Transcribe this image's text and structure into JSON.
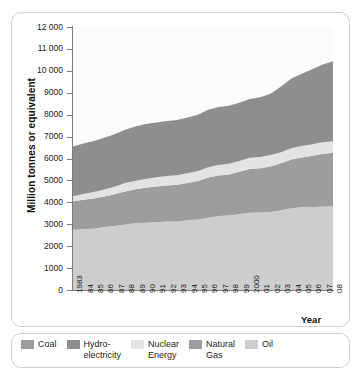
{
  "chart_data": {
    "type": "area",
    "stacked": true,
    "title": "",
    "subtitle": "",
    "xlabel": "Year",
    "ylabel": "Million tonnes or equivalent",
    "ylim": [
      0,
      12000
    ],
    "ytick_step": 1000,
    "ytick_labels": [
      "12 000",
      "11 000",
      "10 000",
      "9000",
      "8000",
      "7000",
      "6000",
      "5000",
      "4000",
      "3000",
      "2000",
      "1000",
      "0"
    ],
    "ytick_values": [
      12000,
      11000,
      10000,
      9000,
      8000,
      7000,
      6000,
      5000,
      4000,
      3000,
      2000,
      1000,
      0
    ],
    "grid": false,
    "legend_position": "bottom",
    "categories": [
      "1983",
      "84",
      "85",
      "86",
      "87",
      "88",
      "89",
      "90",
      "91",
      "92",
      "93",
      "94",
      "95",
      "96",
      "97",
      "98",
      "99",
      "2000",
      "01",
      "02",
      "03",
      "04",
      "05",
      "06",
      "07",
      "08"
    ],
    "x": [
      1983,
      1984,
      1985,
      1986,
      1987,
      1988,
      1989,
      1990,
      1991,
      1992,
      1993,
      1994,
      1995,
      1996,
      1997,
      1998,
      1999,
      2000,
      2001,
      2002,
      2003,
      2004,
      2005,
      2006,
      2007,
      2008
    ],
    "stack_order_bottom_to_top": [
      "Oil",
      "Natural Gas",
      "Nuclear Energy",
      "Hydro-electricity",
      "Coal"
    ],
    "series": [
      {
        "name": "Oil",
        "color": "#cdcdcd",
        "values": [
          2750,
          2780,
          2790,
          2870,
          2920,
          2990,
          3040,
          3070,
          3090,
          3120,
          3120,
          3180,
          3220,
          3300,
          3380,
          3400,
          3470,
          3520,
          3540,
          3560,
          3640,
          3730,
          3770,
          3790,
          3810,
          3820
        ]
      },
      {
        "name": "Natural Gas",
        "color": "#9d9d9d",
        "values": [
          1300,
          1340,
          1380,
          1400,
          1450,
          1510,
          1560,
          1600,
          1630,
          1650,
          1680,
          1700,
          1750,
          1830,
          1840,
          1870,
          1920,
          2000,
          2020,
          2080,
          2140,
          2220,
          2270,
          2330,
          2400,
          2440
        ]
      },
      {
        "name": "Nuclear Energy",
        "color": "#e3e3e3",
        "values": [
          230,
          260,
          300,
          320,
          340,
          380,
          390,
          400,
          420,
          430,
          440,
          450,
          460,
          470,
          480,
          490,
          500,
          510,
          510,
          520,
          510,
          520,
          530,
          530,
          530,
          530
        ]
      },
      {
        "name": "Hydro-electricity",
        "color": "#8e8e8e",
        "values": [
          2270,
          2300,
          2330,
          2360,
          2400,
          2430,
          2470,
          2500,
          2500,
          2510,
          2520,
          2540,
          2570,
          2620,
          2650,
          2650,
          2650,
          2690,
          2720,
          2800,
          3000,
          3180,
          3300,
          3420,
          3550,
          3650
        ]
      },
      {
        "name": "Coal",
        "color": "#bdbdbd",
        "values": [
          0,
          0,
          0,
          0,
          0,
          0,
          0,
          0,
          0,
          0,
          0,
          0,
          0,
          0,
          0,
          0,
          0,
          0,
          0,
          0,
          0,
          0,
          0,
          0,
          0,
          0
        ]
      }
    ],
    "totals": [
      6550,
      6680,
      6800,
      6950,
      7110,
      7310,
      7460,
      7570,
      7640,
      7710,
      7760,
      7870,
      8000,
      8220,
      8350,
      8410,
      8540,
      8720,
      8790,
      8960,
      9290,
      9650,
      9870,
      10070,
      10290,
      10440
    ],
    "annotations": []
  },
  "legend": {
    "items": [
      {
        "label": "Coal",
        "color": "#9d9d9d"
      },
      {
        "label": "Hydro-\nelectricity",
        "label_line1": "Hydro-",
        "label_line2": "electricity",
        "color": "#8e8e8e"
      },
      {
        "label": "Nuclear\nEnergy",
        "label_line1": "Nuclear",
        "label_line2": "Energy",
        "color": "#e3e3e3"
      },
      {
        "label": "Natural\nGas",
        "label_line1": "Natural",
        "label_line2": "Gas",
        "color": "#9d9d9d"
      },
      {
        "label": "Oil",
        "color": "#cdcdcd"
      }
    ]
  },
  "axis_titles": {
    "x": "Year",
    "y": "Million tonnes or equivalent"
  }
}
